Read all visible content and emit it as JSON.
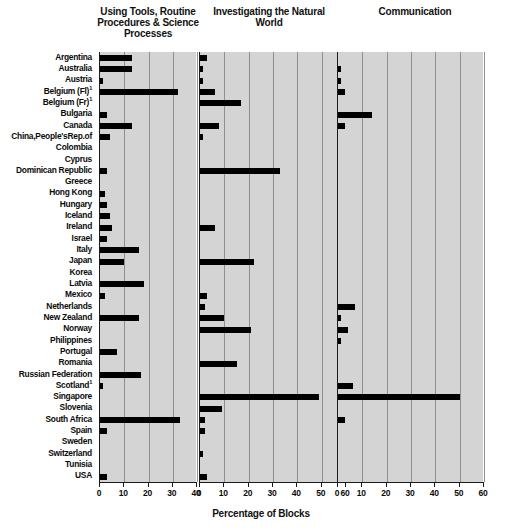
{
  "chart": {
    "xlabel": "Percentage of Blocks",
    "panels": [
      {
        "title": "Using Tools, Routine Procedures & Science Processes",
        "xmin": 0,
        "xmax": 40,
        "ticks": [
          0,
          10,
          20,
          30,
          40
        ]
      },
      {
        "title": "Investigating the Natural World",
        "xmin": 0,
        "xmax": 60,
        "ticks": [
          0,
          10,
          20,
          30,
          40,
          50,
          60
        ]
      },
      {
        "title": "Communication",
        "xmin": 0,
        "xmax": 60,
        "ticks": [
          0,
          10,
          20,
          30,
          40,
          50,
          60
        ]
      }
    ]
  },
  "chart_data": {
    "type": "bar",
    "orientation": "horizontal",
    "title": "",
    "xlabel": "Percentage of Blocks",
    "ylabel": "",
    "grid": true,
    "legend": "none",
    "panel_layout": "three horizontal panels sharing country categories",
    "categories": [
      "Argentina",
      "Australia",
      "Austria",
      "Belgium (Fl)",
      "Belgium (Fr)",
      "Bulgaria",
      "Canada",
      "China,People'sRep.of",
      "Colombia",
      "Cyprus",
      "Dominican Republic",
      "Greece",
      "Hong Kong",
      "Hungary",
      "Iceland",
      "Ireland",
      "Israel",
      "Italy",
      "Japan",
      "Korea",
      "Latvia",
      "Mexico",
      "Netherlands",
      "New Zealand",
      "Norway",
      "Philippines",
      "Portugal",
      "Romania",
      "Russian Federation",
      "Scotland",
      "Singapore",
      "Slovenia",
      "South Africa",
      "Spain",
      "Sweden",
      "Switzerland",
      "Tunisia",
      "USA"
    ],
    "category_footnotes": {
      "Belgium (Fl)": "1",
      "Belgium (Fr)": "1",
      "Scotland": "1"
    },
    "panels": [
      {
        "name": "Using Tools, Routine Procedures & Science Processes",
        "xlim": [
          0,
          40
        ],
        "xticks": [
          0,
          10,
          20,
          30,
          40
        ],
        "values": [
          13,
          13,
          1,
          32,
          0,
          3,
          13,
          4,
          0,
          0,
          3,
          0,
          2,
          3,
          4,
          5,
          3,
          16,
          10,
          0,
          18,
          2,
          0,
          16,
          0,
          0,
          7,
          0,
          17,
          1,
          0,
          0,
          33,
          3,
          0,
          0,
          0,
          3
        ]
      },
      {
        "name": "Investigating the Natural World",
        "xlim": [
          0,
          60
        ],
        "xticks": [
          0,
          10,
          20,
          30,
          40,
          50,
          60
        ],
        "values": [
          3,
          1,
          1,
          6,
          17,
          0,
          8,
          1,
          0,
          0,
          33,
          0,
          0,
          0,
          0,
          6,
          0,
          0,
          22,
          0,
          0,
          3,
          2,
          10,
          21,
          0,
          0,
          15,
          0,
          0,
          49,
          9,
          2,
          2,
          0,
          1,
          0,
          3
        ]
      },
      {
        "name": "Communication",
        "xlim": [
          0,
          60
        ],
        "xticks": [
          0,
          10,
          20,
          30,
          40,
          50,
          60
        ],
        "values": [
          0,
          1,
          1,
          3,
          0,
          14,
          3,
          0,
          0,
          0,
          0,
          0,
          0,
          0,
          0,
          0,
          0,
          0,
          0,
          0,
          0,
          0,
          7,
          1,
          4,
          1,
          0,
          0,
          0,
          6,
          50,
          0,
          3,
          0,
          0,
          0,
          0,
          0
        ]
      }
    ]
  }
}
